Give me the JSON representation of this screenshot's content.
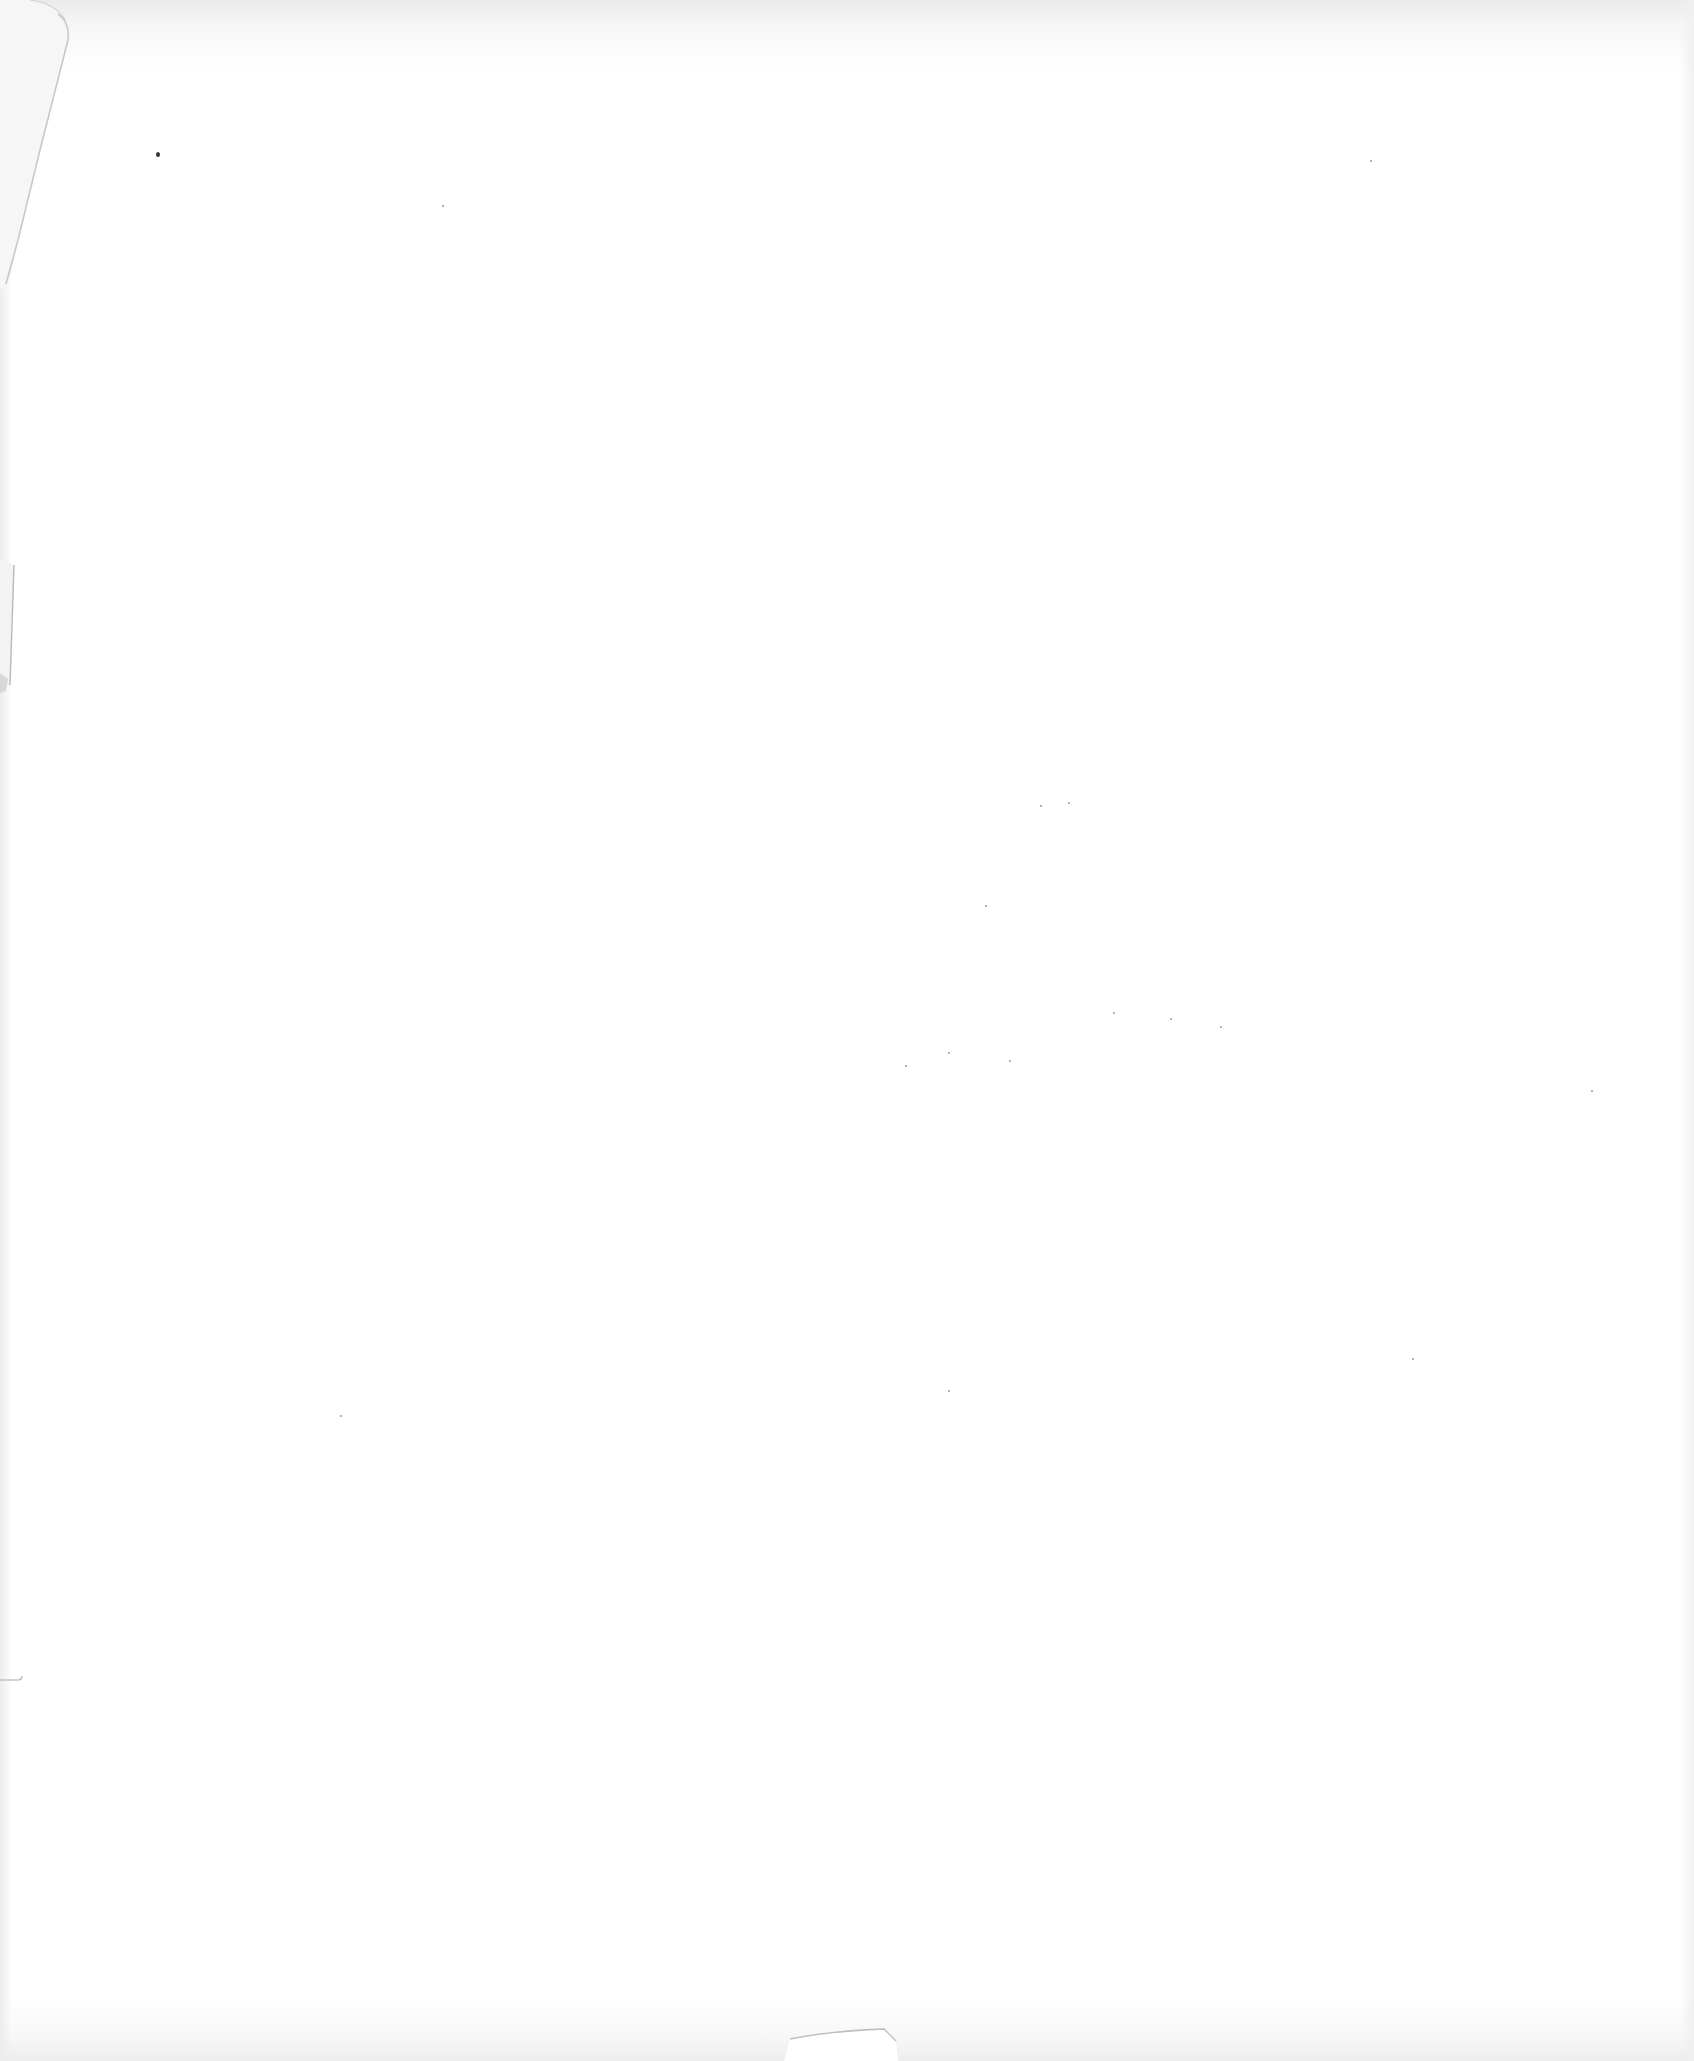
{
  "document": {
    "type": "scanned blank page",
    "text_content": [],
    "paper_color": "#ffffff",
    "edge_shadow_color": "#ebebeb"
  }
}
